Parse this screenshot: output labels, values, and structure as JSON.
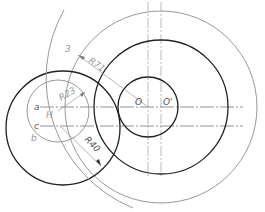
{
  "diagram": {
    "type": "technical-drawing",
    "labels": {
      "O": "O",
      "O_prime": "O'",
      "a": "a",
      "c": "c",
      "H": "H",
      "b": "b",
      "three": "3",
      "R71": "R71",
      "R23": "R23",
      "R40": "R40"
    },
    "colors": {
      "dark_line": "#222222",
      "grey_line": "#999999",
      "center_line": "#aaaaaa",
      "background": "#ffffff"
    }
  }
}
